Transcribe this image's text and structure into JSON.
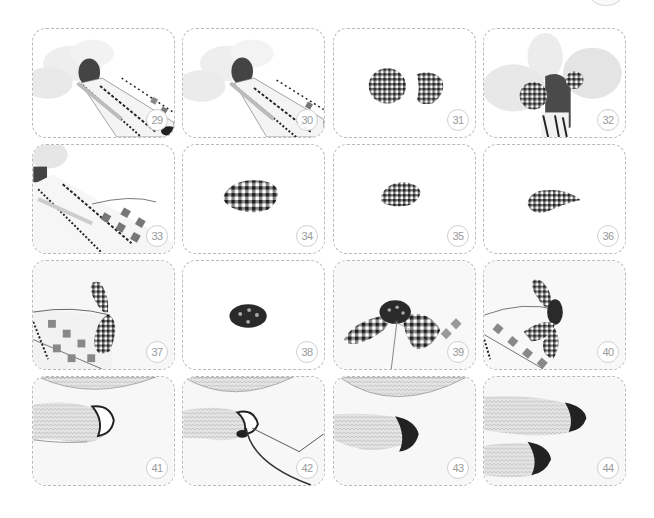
{
  "page": {
    "type": "craft-tutorial-photo-grid",
    "layout": {
      "rows": 4,
      "columns": 4
    }
  },
  "steps": [
    {
      "number": "29",
      "subject": "doll body with embroidered cloth wrapped diagonally, cloud-shaped wings behind"
    },
    {
      "number": "30",
      "subject": "doll body wrapped further with embroidered cloth, wings behind"
    },
    {
      "number": "31",
      "subject": "two round gingham fabric pieces"
    },
    {
      "number": "32",
      "subject": "gingham piece attached to doll head among wings"
    },
    {
      "number": "33",
      "subject": "embroidered cloth with needle and thread close-up"
    },
    {
      "number": "34",
      "subject": "oval gingham fabric piece"
    },
    {
      "number": "35",
      "subject": "smaller gathered gingham piece"
    },
    {
      "number": "36",
      "subject": "teardrop shaped gingham petal"
    },
    {
      "number": "37",
      "subject": "gingham petals stitched onto embroidered body"
    },
    {
      "number": "38",
      "subject": "small dark polka-dot oval button piece"
    },
    {
      "number": "39",
      "subject": "gingham flower with dark center and thread"
    },
    {
      "number": "40",
      "subject": "finished gingham flower attached to body"
    },
    {
      "number": "41",
      "subject": "knitted foot with crescent outline stitched"
    },
    {
      "number": "42",
      "subject": "filling crescent with dark thread using needle"
    },
    {
      "number": "43",
      "subject": "completed dark crescent on knitted foot"
    },
    {
      "number": "44",
      "subject": "two knitted feet with dark crescents"
    }
  ],
  "colors": {
    "panel_border": "#b9b9b9",
    "badge_border": "#cfcfcf",
    "badge_text": "#9a9a9a",
    "fabric_dark": "#2b2b2b",
    "background": "#ffffff"
  }
}
